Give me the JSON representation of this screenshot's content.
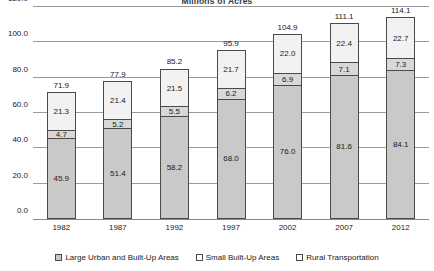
{
  "chart_data": {
    "type": "bar",
    "subtype": "stacked-column",
    "title": "Millions of Acres",
    "xlabel": "",
    "ylabel": "",
    "ylim": [
      0,
      120
    ],
    "ytick_step": 20,
    "ytick_labels": [
      "0.0",
      "20.0",
      "40.0",
      "60.0",
      "80.0",
      "100.0",
      "120.0"
    ],
    "grid": true,
    "legend_position": "bottom",
    "categories": [
      "1982",
      "1987",
      "1992",
      "1997",
      "2002",
      "2007",
      "2012"
    ],
    "totals": [
      71.9,
      77.9,
      85.2,
      95.9,
      104.9,
      111.1,
      114.1
    ],
    "total_labels": [
      "71.9",
      "77.9",
      "85.2",
      "95.9",
      "104.9",
      "111.1",
      "114.1"
    ],
    "series": [
      {
        "name": "Rural Transportation",
        "color": "#c9c9c9",
        "values": [
          45.9,
          51.4,
          58.2,
          68.0,
          76.0,
          81.6,
          84.1
        ],
        "labels": [
          "45.9",
          "51.4",
          "58.2",
          "68.0",
          "76.0",
          "81.6",
          "84.1"
        ]
      },
      {
        "name": "Small Built-Up Areas",
        "color": "#d8d8d8",
        "values": [
          4.7,
          5.2,
          5.5,
          6.2,
          6.9,
          7.1,
          7.3
        ],
        "labels": [
          "4.7",
          "5.2",
          "5.5",
          "6.2",
          "6.9",
          "7.1",
          "7.3"
        ]
      },
      {
        "name": "Large Urban and Built-Up Areas",
        "color": "#f2f2f2",
        "values": [
          21.3,
          21.4,
          21.5,
          21.7,
          22.0,
          22.4,
          22.7
        ],
        "labels": [
          "21.3",
          "21.4",
          "21.5",
          "21.7",
          "22.0",
          "22.4",
          "22.7"
        ]
      }
    ],
    "legend_entries": [
      {
        "label": "Large Urban and Built-Up Areas",
        "swatch": "#c9c9c9"
      },
      {
        "label": "Small Built-Up Areas",
        "swatch": "#ffffff"
      },
      {
        "label": "Rural Transportation",
        "swatch": "#ffffff"
      }
    ]
  }
}
